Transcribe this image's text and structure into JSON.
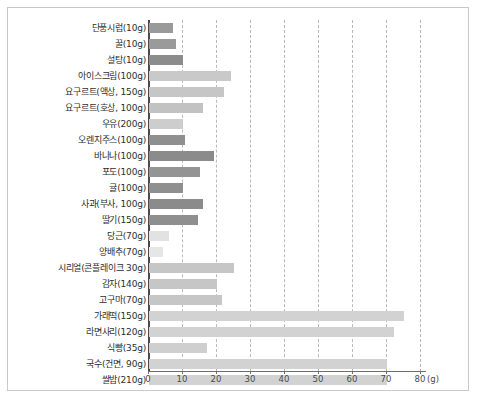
{
  "chart_data": {
    "type": "bar",
    "orientation": "horizontal",
    "title": "",
    "xlabel": "(g)",
    "ylabel": "",
    "xlim": [
      0,
      80
    ],
    "xticks": [
      0,
      10,
      20,
      30,
      40,
      50,
      60,
      70,
      80
    ],
    "xtick_labels": [
      "0",
      "10",
      "20",
      "30",
      "40",
      "50",
      "60",
      "70",
      "80"
    ],
    "unit_suffix": "(g)",
    "grid": true,
    "grid_style": "dashed-vertical",
    "legend": "none",
    "categories": [
      "단풍시럽(10g)",
      "꿀(10g)",
      "설탕(10g)",
      "아이스크림(100g)",
      "요구르트(액상, 150g)",
      "요구르트(호상, 100g)",
      "우유(200g)",
      "오렌지주스(100g)",
      "바나나(100g)",
      "포도(100g)",
      "귤(100g)",
      "사과(부사, 100g)",
      "딸기(150g)",
      "당근(70g)",
      "양배추(70g)",
      "시리얼(콘플레이크 30g)",
      "감자(140g)",
      "고구마(70g)",
      "가래떡(150g)",
      "라면사리(120g)",
      "식빵(35g)",
      "국수(건면, 90g)",
      "쌀밥(210g)"
    ],
    "values": [
      7.0,
      8.0,
      10.0,
      24.0,
      22.0,
      16.0,
      10.0,
      10.5,
      19.0,
      15.0,
      10.0,
      16.0,
      14.5,
      6.0,
      4.0,
      25.0,
      20.0,
      21.5,
      75.0,
      72.0,
      17.0,
      70.0,
      70.0
    ],
    "bar_colors": [
      "#9a9a9a",
      "#9a9a9a",
      "#8c8c8c",
      "#c9c9c9",
      "#c6c6c6",
      "#c2c2c2",
      "#cdcdcd",
      "#8f8f8f",
      "#8b8b8b",
      "#949494",
      "#8f8f8f",
      "#8b8b8b",
      "#8f8f8f",
      "#e2e2e2",
      "#e6e6e6",
      "#c6c6c6",
      "#c6c6c6",
      "#c6c6c6",
      "#d2d2d2",
      "#d2d2d2",
      "#cfcfcf",
      "#d2d2d2",
      "#d2d2d2"
    ]
  },
  "style": {
    "frame_border": "#c9c9c9",
    "axis_color": "#4a4a4a",
    "grid_color": "#b9b9b9",
    "text_color": "#2e2e2e",
    "background": "#ffffff"
  }
}
